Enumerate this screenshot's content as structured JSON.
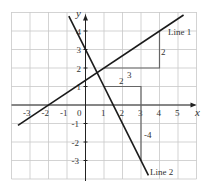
{
  "axes": {
    "x_label": "x",
    "y_label": "y",
    "x_ticks": [
      "-3",
      "-2",
      "-1",
      "1",
      "2",
      "3",
      "4",
      "5"
    ],
    "y_ticks": [
      "-3",
      "-2",
      "-1",
      "1",
      "2",
      "3",
      "4"
    ],
    "origin_label": "0",
    "x_range": [
      -4,
      6
    ],
    "y_range": [
      -4,
      5
    ]
  },
  "lines": [
    {
      "name": "Line 1",
      "label": "Line 1",
      "slope": "2/3",
      "intercept": "4/3",
      "triangle": {
        "run_label": "3",
        "rise_label": "2"
      }
    },
    {
      "name": "Line 2",
      "label": "Line 2",
      "slope": "-2",
      "intercept": "3",
      "triangle": {
        "run_label": "2",
        "rise_label": "-4"
      }
    }
  ],
  "colors": {
    "line": "#1a1a1a",
    "grid": "#c8c8c8",
    "triangle": "#666666",
    "text": "#333333"
  }
}
